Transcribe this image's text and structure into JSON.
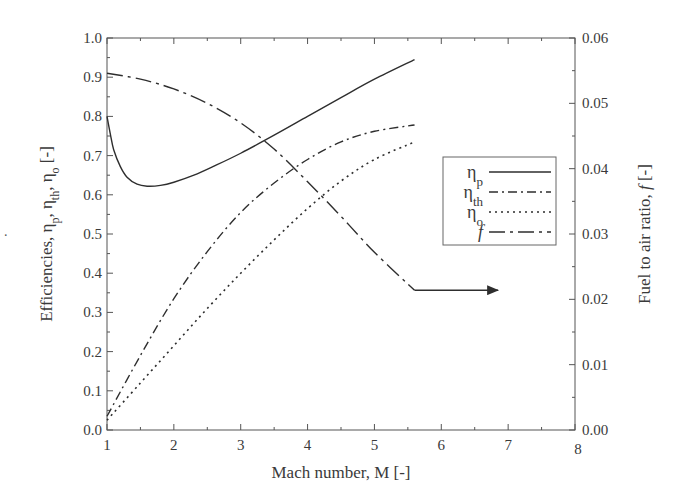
{
  "chart_data": {
    "type": "line",
    "title": "",
    "xlabel": "Mach number, M [-]",
    "ylabel_left": "Efficiencies, ηp, ηth, ηo [-]",
    "ylabel_right": "Fuel to air ratio, f [-]",
    "xlim": [
      1,
      8
    ],
    "ylim_left": [
      0.0,
      1.0
    ],
    "ylim_right": [
      0.0,
      0.06
    ],
    "x_ticks": [
      "1",
      "2",
      "3",
      "4",
      "5",
      "6",
      "7",
      "8"
    ],
    "y_left_ticks": [
      "0.0",
      "0.1",
      "0.2",
      "0.3",
      "0.4",
      "0.5",
      "0.6",
      "0.7",
      "0.8",
      "0.9",
      "1.0"
    ],
    "y_right_ticks": [
      "0.00",
      "0.01",
      "0.02",
      "0.03",
      "0.04",
      "0.05",
      "0.06"
    ],
    "grid": false,
    "legend_position": "right-center inside",
    "series": [
      {
        "name": "ηp",
        "label_main": "η",
        "label_sub": "p",
        "axis": "left",
        "style": "solid",
        "x": [
          1.0,
          1.05,
          1.1,
          1.2,
          1.3,
          1.45,
          1.6,
          1.8,
          2.0,
          2.3,
          2.6,
          3.0,
          3.5,
          4.0,
          4.5,
          5.0,
          5.6
        ],
        "y": [
          0.8,
          0.755,
          0.715,
          0.672,
          0.645,
          0.627,
          0.622,
          0.624,
          0.632,
          0.65,
          0.673,
          0.706,
          0.752,
          0.8,
          0.848,
          0.895,
          0.945
        ]
      },
      {
        "name": "ηth",
        "label_main": "η",
        "label_sub": "th",
        "axis": "left",
        "style": "dashdot",
        "x": [
          1.0,
          1.5,
          2.0,
          2.5,
          3.0,
          3.5,
          4.0,
          4.5,
          5.0,
          5.6
        ],
        "y": [
          0.035,
          0.19,
          0.335,
          0.455,
          0.555,
          0.63,
          0.69,
          0.735,
          0.762,
          0.778
        ]
      },
      {
        "name": "ηo",
        "label_main": "η",
        "label_sub": "o",
        "axis": "left",
        "style": "dotted",
        "x": [
          1.0,
          1.5,
          2.0,
          2.5,
          3.0,
          3.5,
          4.0,
          4.5,
          5.0,
          5.6
        ],
        "y": [
          0.025,
          0.12,
          0.215,
          0.31,
          0.4,
          0.485,
          0.565,
          0.635,
          0.69,
          0.735
        ]
      },
      {
        "name": "f",
        "label_main": "f",
        "label_sub": "",
        "axis": "right",
        "style": "longdashdot",
        "x": [
          1.0,
          1.5,
          2.0,
          2.5,
          3.0,
          3.5,
          4.0,
          4.5,
          5.0,
          5.6
        ],
        "y": [
          0.0546,
          0.0537,
          0.0522,
          0.05,
          0.047,
          0.043,
          0.038,
          0.0327,
          0.0272,
          0.0214
        ]
      }
    ],
    "annotations": [
      {
        "type": "arrow",
        "from_x": 5.6,
        "from_y_right": 0.0214,
        "to_x": 6.85,
        "label": "points to right axis (f)"
      }
    ],
    "colors": {
      "line": "#2e2e2e",
      "axis": "#555555",
      "text": "#3a3a3a"
    }
  }
}
